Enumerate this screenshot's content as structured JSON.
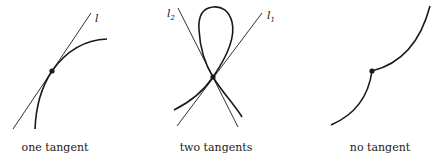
{
  "panels": [
    {
      "caption": "one tangent",
      "tangent_labels": [
        "l"
      ]
    },
    {
      "caption": "two tangents",
      "tangent_labels": [
        "l",
        "l"
      ],
      "tangent_subscripts": [
        "2",
        "1"
      ]
    },
    {
      "caption": "no tangent",
      "tangent_labels": []
    }
  ],
  "colors": {
    "stroke": "#1a1a1a",
    "background": "#ffffff"
  }
}
